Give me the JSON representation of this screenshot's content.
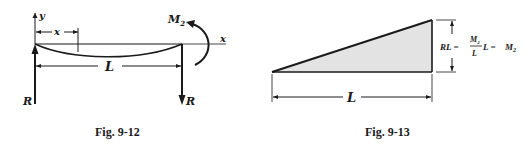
{
  "figures": [
    {
      "caption": "Fig. 9-12",
      "labels": {
        "y_axis": "y",
        "x_axis": "x",
        "x_dim": "x",
        "length": "L",
        "moment": "M",
        "moment_sub": "2",
        "reaction_left": "R",
        "reaction_right": "R"
      }
    },
    {
      "caption": "Fig. 9-13",
      "labels": {
        "length": "L",
        "height_lhs": "RL =",
        "frac_num": "M",
        "frac_num_sub": "2",
        "frac_den": "L",
        "after_frac": "L =",
        "rhs": "M",
        "rhs_sub": "2"
      }
    }
  ],
  "colors": {
    "ink": "#1a1a1a",
    "shade": "#d9d9d9"
  }
}
